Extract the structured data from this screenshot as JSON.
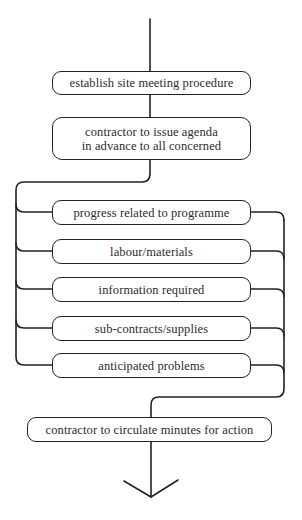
{
  "diagram": {
    "type": "flowchart",
    "start_box": {
      "label": "establish site meeting procedure"
    },
    "agenda_box": {
      "line1": "contractor to issue agenda",
      "line2": "in advance to all concerned"
    },
    "agenda_items": [
      {
        "label": "progress related to programme"
      },
      {
        "label": "labour/materials"
      },
      {
        "label": "information required"
      },
      {
        "label": "sub-contracts/supplies"
      },
      {
        "label": "anticipated problems"
      }
    ],
    "end_box": {
      "label": "contractor to circulate minutes for action"
    },
    "exit_arrow": "arrow-down",
    "colors": {
      "stroke": "#222222",
      "text": "#2b2b2b",
      "background": "#ffffff"
    }
  }
}
